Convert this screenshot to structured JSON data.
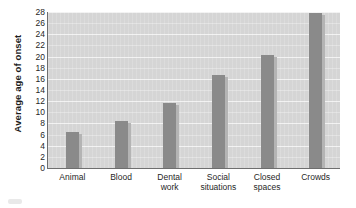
{
  "chart_data": {
    "type": "bar",
    "title": "",
    "xlabel": "",
    "ylabel": "Average age of onset",
    "categories": [
      "Animal",
      "Blood",
      "Dental work",
      "Social situations",
      "Closed spaces",
      "Crowds"
    ],
    "category_lines": [
      [
        "Animal"
      ],
      [
        "Blood"
      ],
      [
        "Dental",
        "work"
      ],
      [
        "Social",
        "situations"
      ],
      [
        "Closed",
        "spaces"
      ],
      [
        "Crowds"
      ]
    ],
    "values": [
      6.5,
      8.5,
      11.7,
      16.7,
      20.3,
      27.8
    ],
    "ylim": [
      0,
      28
    ],
    "ytick_values": [
      0,
      2,
      4,
      6,
      8,
      10,
      12,
      14,
      16,
      18,
      20,
      22,
      24,
      26,
      28
    ],
    "ytick_labels": [
      "0",
      "2",
      "4",
      "6",
      "8",
      "10",
      "12",
      "14",
      "16",
      "18",
      "20",
      "22",
      "24",
      "26",
      "28"
    ],
    "grid": true,
    "legend": false,
    "legend_position": "none",
    "colors": {
      "bar": "#8a8a8a",
      "bar_shadow": "#b4b4b4",
      "plot_background": "#d5d5d5",
      "gridline": "#f2f2f2",
      "axis": "#6e6e6e",
      "text": "#1f1f1f",
      "page_background": "#ffffff"
    }
  }
}
